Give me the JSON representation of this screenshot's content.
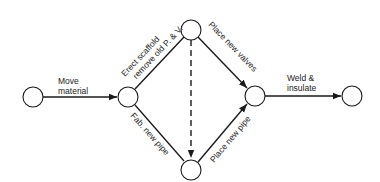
{
  "diagram": {
    "type": "activity-network",
    "nodes": [
      {
        "id": "n1",
        "cx": 33,
        "cy": 97
      },
      {
        "id": "n2",
        "cx": 128,
        "cy": 97
      },
      {
        "id": "n3",
        "cx": 191,
        "cy": 30
      },
      {
        "id": "n4",
        "cx": 191,
        "cy": 170
      },
      {
        "id": "n5",
        "cx": 255,
        "cy": 96
      },
      {
        "id": "n6",
        "cx": 352,
        "cy": 96
      }
    ],
    "edges": [
      {
        "from": "n1",
        "to": "n2",
        "label_line1": "Move",
        "label_line2": "material",
        "style": "solid"
      },
      {
        "from": "n2",
        "to": "n3",
        "label_line1": "Erect scaffold",
        "label_line2": "remove old P. & V.",
        "style": "solid"
      },
      {
        "from": "n2",
        "to": "n4",
        "label": "Fab. new pipe",
        "style": "solid"
      },
      {
        "from": "n3",
        "to": "n4",
        "label": "",
        "style": "dashed"
      },
      {
        "from": "n3",
        "to": "n5",
        "label": "Place new valves",
        "style": "solid"
      },
      {
        "from": "n4",
        "to": "n5",
        "label": "Place new pipe",
        "style": "solid"
      },
      {
        "from": "n5",
        "to": "n6",
        "label_line1": "Weld &",
        "label_line2": "insulate",
        "style": "solid"
      }
    ]
  }
}
